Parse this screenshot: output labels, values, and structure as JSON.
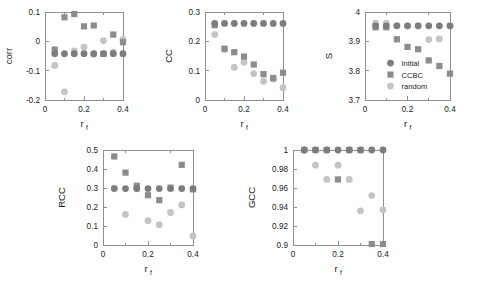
{
  "figure": {
    "background": "#ffffff",
    "xlabel": "r",
    "xlabel_sub": "f"
  },
  "series_styles": {
    "initial": {
      "name": "Initial",
      "color": "#7d7d7d",
      "marker": "circle"
    },
    "ccbc": {
      "name": "CCBC",
      "color": "#8c8c8c",
      "marker": "square"
    },
    "random": {
      "name": "random",
      "color": "#c4c4c4",
      "marker": "circle"
    }
  },
  "legend": {
    "panel": "S",
    "entries": [
      {
        "label": "Initial",
        "marker": "circle",
        "color": "#7d7d7d"
      },
      {
        "label": "CCBC",
        "marker": "square",
        "color": "#8c8c8c"
      },
      {
        "label": "random",
        "marker": "circle",
        "color": "#c4c4c4"
      }
    ]
  },
  "chart_data": [
    {
      "id": "corr",
      "type": "scatter",
      "title": "",
      "xlabel": "r_f",
      "ylabel": "corr",
      "xlim": [
        0,
        0.4
      ],
      "ylim": [
        -0.2,
        0.1
      ],
      "xticks": [
        0,
        0.2,
        0.4
      ],
      "xticklabels": [
        "0",
        "0.2",
        "0.4"
      ],
      "xminorticks": [
        0.1,
        0.3
      ],
      "yticks": [
        -0.2,
        -0.1,
        0,
        0.1
      ],
      "yticklabels": [
        "-0.2",
        "-0.1",
        "0",
        "0.1"
      ],
      "grid": false,
      "x": [
        0.05,
        0.1,
        0.15,
        0.2,
        0.25,
        0.3,
        0.35,
        0.4
      ],
      "series": [
        {
          "name": "Initial",
          "values": [
            -0.042,
            -0.042,
            -0.042,
            -0.042,
            -0.042,
            -0.042,
            -0.042,
            -0.042
          ]
        },
        {
          "name": "CCBC",
          "values": [
            -0.028,
            0.082,
            0.093,
            0.051,
            0.054,
            -0.043,
            0.023,
            -0.003
          ]
        },
        {
          "name": "random",
          "values": [
            -0.082,
            -0.172,
            -0.033,
            -0.02,
            -0.044,
            0.002,
            -0.037,
            0.007
          ]
        }
      ]
    },
    {
      "id": "cc",
      "type": "scatter",
      "title": "",
      "xlabel": "r_f",
      "ylabel": "CC",
      "xlim": [
        0,
        0.4
      ],
      "ylim": [
        0,
        0.3
      ],
      "xticks": [
        0,
        0.2,
        0.4
      ],
      "xticklabels": [
        "0",
        "0.2",
        "0.4"
      ],
      "xminorticks": [
        0.1,
        0.3
      ],
      "yticks": [
        0,
        0.1,
        0.2,
        0.3
      ],
      "yticklabels": [
        "0",
        "0.1",
        "0.2",
        "0.3"
      ],
      "grid": false,
      "x": [
        0.05,
        0.1,
        0.15,
        0.2,
        0.25,
        0.3,
        0.35,
        0.4
      ],
      "series": [
        {
          "name": "Initial",
          "values": [
            0.261,
            0.261,
            0.261,
            0.261,
            0.261,
            0.261,
            0.261,
            0.261
          ]
        },
        {
          "name": "CCBC",
          "values": [
            0.255,
            0.175,
            0.163,
            0.148,
            0.121,
            0.088,
            0.075,
            0.093
          ]
        },
        {
          "name": "random",
          "values": [
            0.223,
            0.172,
            0.111,
            0.129,
            0.09,
            0.064,
            0.071,
            0.042
          ]
        }
      ]
    },
    {
      "id": "s",
      "type": "scatter",
      "title": "",
      "xlabel": "r_f",
      "ylabel": "S",
      "xlim": [
        0,
        0.4
      ],
      "ylim": [
        3.7,
        4.0
      ],
      "xticks": [
        0,
        0.2,
        0.4
      ],
      "xticklabels": [
        "0",
        "0.2",
        "0.4"
      ],
      "xminorticks": [
        0.1,
        0.3
      ],
      "yticks": [
        3.7,
        3.8,
        3.9,
        4.0
      ],
      "yticklabels": [
        "3.7",
        "3.8",
        "3.9",
        "4"
      ],
      "grid": false,
      "x": [
        0.05,
        0.1,
        0.15,
        0.2,
        0.25,
        0.3,
        0.35,
        0.4
      ],
      "series": [
        {
          "name": "Initial",
          "values": [
            3.953,
            3.953,
            3.953,
            3.953,
            3.953,
            3.953,
            3.953,
            3.953
          ]
        },
        {
          "name": "CCBC",
          "values": [
            3.948,
            3.948,
            3.907,
            3.881,
            3.873,
            3.835,
            3.816,
            3.79
          ]
        },
        {
          "name": "random",
          "values": [
            3.962,
            3.962,
            3.953,
            3.953,
            3.953,
            3.906,
            3.908,
            3.953
          ]
        }
      ]
    },
    {
      "id": "rcc",
      "type": "scatter",
      "title": "",
      "xlabel": "r_f",
      "ylabel": "RCC",
      "xlim": [
        0,
        0.4
      ],
      "ylim": [
        0,
        0.5
      ],
      "xticks": [
        0,
        0.2,
        0.4
      ],
      "xticklabels": [
        "0",
        "0.2",
        "0.4"
      ],
      "xminorticks": [
        0.1,
        0.3
      ],
      "yticks": [
        0,
        0.1,
        0.2,
        0.3,
        0.4,
        0.5
      ],
      "yticklabels": [
        "0",
        "0.1",
        "0.2",
        "0.3",
        "0.4",
        "0.5"
      ],
      "grid": false,
      "x": [
        0.05,
        0.1,
        0.15,
        0.2,
        0.25,
        0.3,
        0.35,
        0.4
      ],
      "series": [
        {
          "name": "Initial",
          "values": [
            0.297,
            0.297,
            0.297,
            0.297,
            0.297,
            0.297,
            0.297,
            0.297
          ]
        },
        {
          "name": "CCBC",
          "values": [
            0.466,
            0.381,
            0.312,
            0.262,
            0.236,
            0.302,
            0.422,
            0.293
          ]
        },
        {
          "name": "random",
          "values": [
            0.299,
            0.161,
            0.296,
            0.128,
            0.107,
            0.171,
            0.211,
            0.048
          ]
        }
      ]
    },
    {
      "id": "gcc",
      "type": "scatter",
      "title": "",
      "xlabel": "r_f",
      "ylabel": "GCC",
      "xlim": [
        0,
        0.4
      ],
      "ylim": [
        0.9,
        1.0
      ],
      "xticks": [
        0,
        0.2,
        0.4
      ],
      "xticklabels": [
        "0",
        "0.2",
        "0.4"
      ],
      "xminorticks": [
        0.1,
        0.3
      ],
      "yticks": [
        0.9,
        0.92,
        0.94,
        0.96,
        0.98,
        1.0
      ],
      "yticklabels": [
        "0.9",
        "0.92",
        "0.94",
        "0.96",
        "0.98",
        "1"
      ],
      "grid": false,
      "x": [
        0.05,
        0.1,
        0.15,
        0.2,
        0.25,
        0.3,
        0.35,
        0.4
      ],
      "series": [
        {
          "name": "Initial",
          "values": [
            1.0,
            1.0,
            1.0,
            1.0,
            1.0,
            1.0,
            1.0,
            1.0
          ]
        },
        {
          "name": "CCBC",
          "values": [
            1.0,
            1.0,
            1.0,
            0.969,
            1.0,
            1.0,
            0.901,
            0.901
          ]
        },
        {
          "name": "random",
          "values": [
            1.0,
            0.984,
            0.969,
            0.984,
            0.969,
            0.936,
            0.952,
            0.937
          ]
        }
      ]
    }
  ]
}
